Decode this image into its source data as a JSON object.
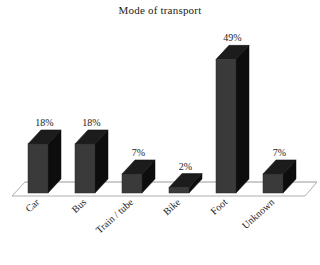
{
  "chart_data": {
    "type": "bar",
    "title": "Mode of transport",
    "categories": [
      "Car",
      "Bus",
      "Train / tube",
      "Bike",
      "Foot",
      "Unknown"
    ],
    "values": [
      18,
      18,
      7,
      2,
      49,
      7
    ],
    "data_labels": [
      "18%",
      "18%",
      "7%",
      "2%",
      "49%",
      "7%"
    ],
    "xlabel": "",
    "ylabel": "",
    "ylim": [
      0,
      55
    ],
    "grid": false,
    "legend": "none",
    "style": "3d-column",
    "colors": {
      "bar_front": "#3a3a3a",
      "bar_side": "#0d0d0d",
      "bar_top": "#1c1c1c",
      "floor_line": "#9a9a9a",
      "baseline": "#8f8f8f",
      "text": "#1a1a1a",
      "background": "#ffffff"
    }
  },
  "footer": {
    "note": ""
  }
}
